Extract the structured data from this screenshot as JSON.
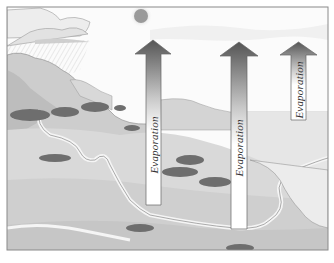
{
  "diagram": {
    "frame": {
      "x": 7,
      "y": 7,
      "width": 321,
      "height": 243,
      "border_color": "#8a8a8a"
    },
    "sun": {
      "cx": 141,
      "cy": 16,
      "r": 7,
      "fill": "#9a9a9a"
    },
    "arrows": [
      {
        "id": "arrow-1",
        "label": "Evaporation",
        "shaft_x": 146,
        "shaft_w": 15,
        "head_top": 40,
        "head_bottom": 54,
        "head_left": 135,
        "head_right": 171,
        "bottom": 205,
        "label_cy": 140
      },
      {
        "id": "arrow-2",
        "label": "Evaporation",
        "shaft_x": 231,
        "shaft_w": 16,
        "head_top": 42,
        "head_bottom": 56,
        "head_left": 220,
        "head_right": 258,
        "bottom": 229,
        "label_cy": 148
      },
      {
        "id": "arrow-3",
        "label": "Evaporation",
        "shaft_x": 291,
        "shaft_w": 15,
        "head_top": 42,
        "head_bottom": 55,
        "head_left": 280,
        "head_right": 317,
        "bottom": 120,
        "label_cy": 90
      }
    ],
    "labels": {
      "arrow_1": "Evaporation",
      "arrow_2": "Evaporation",
      "arrow_3": "Evaporation"
    },
    "colors": {
      "arrow_dark": "#5a5a5a",
      "arrow_light": "#ffffff",
      "land": "#cfcfcf",
      "land_dark": "#a9a9a9",
      "water": "#e4e4e4",
      "sky": "#ffffff",
      "trees": "#6e6e6e"
    }
  }
}
